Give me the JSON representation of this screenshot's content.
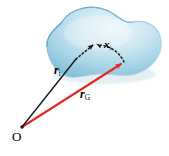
{
  "figure": {
    "background_color": "#ffffff",
    "width": 169,
    "height": 156
  },
  "body_region": {
    "name": "rigid-body-blob",
    "fill_light": "#dff0f6",
    "fill_mid": "#a8d4e6",
    "fill_dark": "#7bb9d4",
    "edge_color": "#6aaecd",
    "shadow_color": "#c9dfe9"
  },
  "vectors": [
    {
      "id": "r_i",
      "label_symbol": "r",
      "label_subscript": "i",
      "color": "#1a1a1a",
      "style": "solid-to-dotted",
      "from": "O",
      "to": "particle i"
    },
    {
      "id": "r_G",
      "label_symbol": "r",
      "label_subscript": "G",
      "color": "#e02b20",
      "style": "solid",
      "from": "O",
      "to": "centre of mass G"
    },
    {
      "id": "x_i",
      "label_symbol": "x",
      "label_subscript": "i",
      "color": "#1a1a1a",
      "style": "dotted",
      "from": "centre of mass G",
      "to": "particle i"
    }
  ],
  "points": [
    {
      "id": "origin",
      "label": "O",
      "color": "#1a1a1a",
      "x": 22,
      "y": 127
    }
  ],
  "labels": {
    "r_i": {
      "symbol": "r",
      "sub": "i"
    },
    "r_G": {
      "symbol": "r",
      "sub": "G"
    },
    "x_i": {
      "symbol": "x",
      "sub": "i"
    },
    "origin": {
      "symbol": "O"
    }
  },
  "colors": {
    "red_vector": "#e02b20",
    "black_vector": "#1a1a1a",
    "blob_fill": "#a8d4e6",
    "background": "#ffffff"
  }
}
